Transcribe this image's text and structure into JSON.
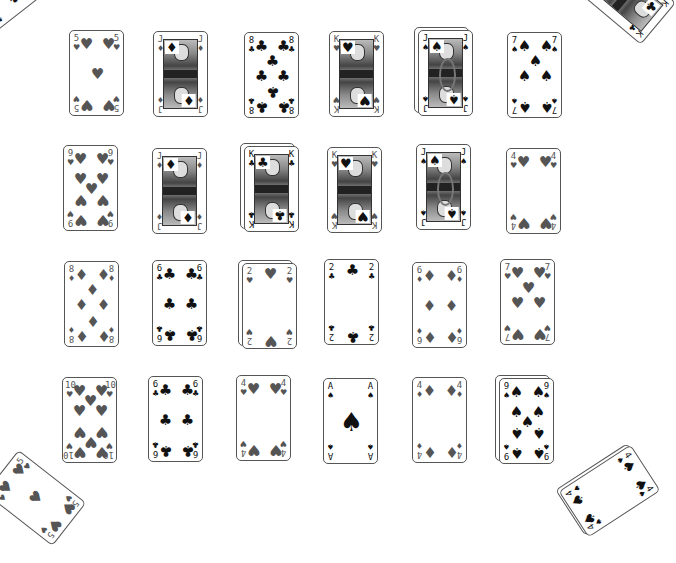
{
  "game": {
    "title": "Solitaire card layout",
    "colors": {
      "background": "#ffffff",
      "card_border": "#555555",
      "red_suit": "#555555",
      "black_suit": "#111111"
    }
  },
  "suits": {
    "H": "♥",
    "D": "♦",
    "C": "♣",
    "S": "♠"
  },
  "grid": {
    "rows": [
      [
        {
          "rank": "5",
          "suit": "H",
          "x": 69,
          "y": 30,
          "stacked": false
        },
        {
          "rank": "J",
          "suit": "D",
          "x": 153,
          "y": 31,
          "stacked": false
        },
        {
          "rank": "8",
          "suit": "C",
          "x": 244,
          "y": 32,
          "stacked": false
        },
        {
          "rank": "K",
          "suit": "H",
          "x": 329,
          "y": 31,
          "stacked": false
        },
        {
          "rank": "J",
          "suit": "S",
          "x": 417,
          "y": 29,
          "stacked": true
        },
        {
          "rank": "7",
          "suit": "S",
          "x": 507,
          "y": 32,
          "stacked": false
        }
      ],
      [
        {
          "rank": "9",
          "suit": "H",
          "x": 63,
          "y": 145,
          "stacked": false
        },
        {
          "rank": "J",
          "suit": "D",
          "x": 152,
          "y": 148,
          "stacked": false
        },
        {
          "rank": "K",
          "suit": "C",
          "x": 243,
          "y": 145,
          "stacked": true
        },
        {
          "rank": "K",
          "suit": "H",
          "x": 327,
          "y": 147,
          "stacked": false
        },
        {
          "rank": "J",
          "suit": "S",
          "x": 416,
          "y": 144,
          "stacked": false
        },
        {
          "rank": "4",
          "suit": "H",
          "x": 506,
          "y": 148,
          "stacked": false
        }
      ],
      [
        {
          "rank": "8",
          "suit": "D",
          "x": 64,
          "y": 261,
          "stacked": false
        },
        {
          "rank": "6",
          "suit": "C",
          "x": 152,
          "y": 260,
          "stacked": false
        },
        {
          "rank": "2",
          "suit": "H",
          "x": 241,
          "y": 262,
          "stacked": true
        },
        {
          "rank": "2",
          "suit": "C",
          "x": 324,
          "y": 259,
          "stacked": false
        },
        {
          "rank": "6",
          "suit": "D",
          "x": 412,
          "y": 262,
          "stacked": false
        },
        {
          "rank": "7",
          "suit": "H",
          "x": 500,
          "y": 259,
          "stacked": false
        }
      ],
      [
        {
          "rank": "10",
          "suit": "H",
          "x": 62,
          "y": 377,
          "stacked": false
        },
        {
          "rank": "6",
          "suit": "C",
          "x": 148,
          "y": 376,
          "stacked": false
        },
        {
          "rank": "4",
          "suit": "H",
          "x": 236,
          "y": 375,
          "stacked": false
        },
        {
          "rank": "A",
          "suit": "S",
          "x": 323,
          "y": 378,
          "stacked": false
        },
        {
          "rank": "4",
          "suit": "D",
          "x": 412,
          "y": 377,
          "stacked": false
        },
        {
          "rank": "9",
          "suit": "S",
          "x": 498,
          "y": 377,
          "stacked": true
        }
      ]
    ]
  },
  "corner_piles": [
    {
      "name": "top-left-pile",
      "rank": "6",
      "suit": "S",
      "x": -20,
      "y": -55,
      "rotate": 52,
      "stacked": false,
      "face": false
    },
    {
      "name": "top-right-pile",
      "rank": "K",
      "suit": "C",
      "x": 598,
      "y": -47,
      "rotate": -50,
      "stacked": false,
      "face": true
    },
    {
      "name": "bottom-left-pile",
      "rank": "5",
      "suit": "H",
      "x": 8,
      "y": 455,
      "rotate": -52,
      "stacked": false,
      "face": false
    },
    {
      "name": "bottom-right-pile",
      "rank": "4",
      "suit": "S",
      "x": 582,
      "y": 448,
      "rotate": 57,
      "stacked": true,
      "face": false
    }
  ]
}
